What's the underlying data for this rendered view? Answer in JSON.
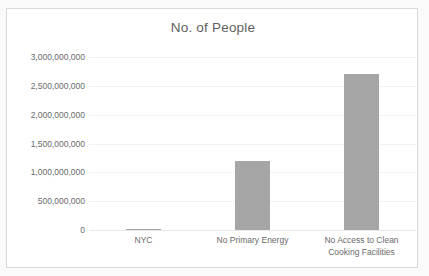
{
  "chart_data": {
    "type": "bar",
    "title": "No. of People",
    "xlabel": "",
    "ylabel": "",
    "categories": [
      "NYC",
      "No Primary Energy",
      "No Access to Clean Cooking Facilities"
    ],
    "category_lines": [
      [
        "NYC"
      ],
      [
        "No Primary Energy"
      ],
      [
        "No Access to Clean",
        "Cooking Facilities"
      ]
    ],
    "values": [
      8400000,
      1200000000,
      2700000000
    ],
    "ylim": [
      0,
      3000000000
    ],
    "ytick_values": [
      3000000000,
      2500000000,
      2000000000,
      1500000000,
      1000000000,
      500000000,
      0
    ],
    "ytick_labels": [
      "3,000,000,000",
      "2,500,000,000",
      "2,000,000,000",
      "1,500,000,000",
      "1,000,000,000",
      "500,000,000",
      "0"
    ],
    "grid": true,
    "legend": false,
    "legend_position": "none",
    "bar_color": "#a6a6a6",
    "text_color": "#6a6a6a",
    "title_color": "#5f5f5f",
    "gridline_color": "#f2f2f2",
    "plot_background": "#ffffff",
    "frame_border_color": "#d9d9d9"
  }
}
